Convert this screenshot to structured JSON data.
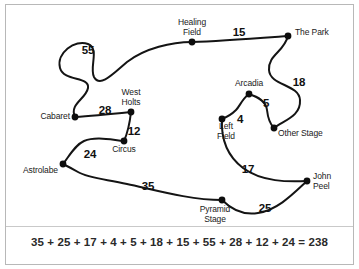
{
  "diagram": {
    "type": "weighted-graph-tour",
    "title": "",
    "nodes": [
      {
        "id": "healing-field",
        "label": "Healing\nField",
        "x": 192,
        "y": 42,
        "label_x": 192,
        "label_y": 18,
        "align": "center"
      },
      {
        "id": "the-park",
        "label": "The Park",
        "x": 288,
        "y": 36,
        "label_x": 295,
        "label_y": 28,
        "align": "left"
      },
      {
        "id": "cabaret",
        "label": "Cabaret",
        "x": 75,
        "y": 117,
        "label_x": 70,
        "label_y": 112,
        "align": "right"
      },
      {
        "id": "west-holts",
        "label": "West\nHolts",
        "x": 131,
        "y": 112,
        "label_x": 131,
        "label_y": 88,
        "align": "center"
      },
      {
        "id": "circus",
        "label": "Circus",
        "x": 124,
        "y": 141,
        "label_x": 124,
        "label_y": 145,
        "align": "center"
      },
      {
        "id": "astrolabe",
        "label": "Astrolabe",
        "x": 63,
        "y": 164,
        "label_x": 58,
        "label_y": 166,
        "align": "right"
      },
      {
        "id": "arcadia",
        "label": "Arcadia",
        "x": 249,
        "y": 94,
        "label_x": 249,
        "label_y": 79,
        "align": "center"
      },
      {
        "id": "left-field",
        "label": "Left\nField",
        "x": 222,
        "y": 119,
        "label_x": 226,
        "label_y": 122,
        "align": "center"
      },
      {
        "id": "other-stage",
        "label": "Other Stage",
        "x": 274,
        "y": 128,
        "label_x": 278,
        "label_y": 129,
        "align": "left"
      },
      {
        "id": "john-peel",
        "label": "John\nPeel",
        "x": 307,
        "y": 181,
        "label_x": 313,
        "label_y": 172,
        "align": "left"
      },
      {
        "id": "pyramid-stage",
        "label": "Pyramid\nStage",
        "x": 222,
        "y": 200,
        "label_x": 215,
        "label_y": 205,
        "align": "center"
      }
    ],
    "edges": [
      {
        "id": "e-cabaret-healing",
        "from": "cabaret",
        "to": "healing-field",
        "weight": "55",
        "weight_x": 88,
        "weight_y": 44,
        "path": "M 75 117 C 69 104 86 99 88 88 C 90 76 64 82 60 68 C 56 53 75 39 88 44 C 100 49 89 67 94 77 C 100 88 113 74 127 62 C 145 48 172 42 192 42"
      },
      {
        "id": "e-healing-park",
        "from": "healing-field",
        "to": "the-park",
        "weight": "15",
        "weight_x": 239,
        "weight_y": 26,
        "path": "M 192 42 C 220 41 260 38 288 36"
      },
      {
        "id": "e-park-otherstage",
        "from": "the-park",
        "to": "other-stage",
        "weight": "18",
        "weight_x": 299,
        "weight_y": 76,
        "path": "M 288 36 C 284 52 268 55 269 70 C 270 86 299 84 300 100 C 301 116 285 120 274 128"
      },
      {
        "id": "e-arcadia-otherstage",
        "from": "arcadia",
        "to": "other-stage",
        "weight": "5",
        "weight_x": 266,
        "weight_y": 97,
        "path": "M 249 94 C 258 97 266 101 267 110 C 268 119 270 124 274 128"
      },
      {
        "id": "e-arcadia-leftfield",
        "from": "arcadia",
        "to": "left-field",
        "weight": "4",
        "weight_x": 240,
        "weight_y": 113,
        "path": "M 249 94 C 242 99 240 106 236 110 C 232 114 227 117 222 119"
      },
      {
        "id": "e-leftfield-johnpeel",
        "from": "left-field",
        "to": "john-peel",
        "weight": "17",
        "weight_x": 248,
        "weight_y": 163,
        "path": "M 222 119 C 221 137 226 155 243 168 C 262 182 288 182 307 181"
      },
      {
        "id": "e-johnpeel-pyramid",
        "from": "john-peel",
        "to": "pyramid-stage",
        "weight": "25",
        "weight_x": 265,
        "weight_y": 202,
        "path": "M 307 181 C 294 193 278 210 258 213 C 240 216 229 207 222 200"
      },
      {
        "id": "e-pyramid-astrolabe",
        "from": "pyramid-stage",
        "to": "astrolabe",
        "weight": "35",
        "weight_x": 148,
        "weight_y": 180,
        "path": "M 222 200 C 190 200 155 190 127 184 C 104 179 88 178 78 172 C 71 168 67 166 63 164"
      },
      {
        "id": "e-astrolabe-circus",
        "from": "astrolabe",
        "to": "circus",
        "weight": "24",
        "weight_x": 90,
        "weight_y": 148,
        "path": "M 63 164 C 70 155 75 145 84 141 C 96 136 112 140 124 141"
      },
      {
        "id": "e-circus-westholts",
        "from": "circus",
        "to": "west-holts",
        "weight": "12",
        "weight_x": 134,
        "weight_y": 125,
        "path": "M 124 141 C 128 132 130 121 131 112"
      },
      {
        "id": "e-westholts-cabaret",
        "from": "west-holts",
        "to": "cabaret",
        "weight": "28",
        "weight_x": 105,
        "weight_y": 104,
        "path": "M 131 112 C 112 114 93 116 75 117"
      }
    ],
    "equation": "35 + 25 + 17 + 4 + 5 + 18 + 15 + 55 + 28 + 12 + 24 = 238",
    "total": 238,
    "weights_in_equation": [
      35,
      25,
      17,
      4,
      5,
      18,
      15,
      55,
      28,
      12,
      24
    ]
  },
  "style": {
    "stroke_color": "#141414",
    "node_color": "#0d0d0d",
    "border_color": "#b8b8b8",
    "background": "#ffffff"
  }
}
